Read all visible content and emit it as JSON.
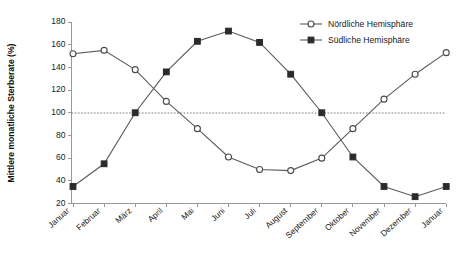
{
  "chart_data": {
    "type": "line",
    "title": "",
    "xlabel": "",
    "ylabel": "Mittlere monatliche Sterberate (%)",
    "ylim": [
      20,
      180
    ],
    "ytick_step": 20,
    "yticks": [
      180,
      160,
      140,
      120,
      100,
      80,
      60,
      40,
      20
    ],
    "grid": false,
    "legend_position": "top-right",
    "reference_line": {
      "value": 100,
      "style": "dotted",
      "label": ""
    },
    "categories": [
      "Januar",
      "Februar",
      "März",
      "April",
      "Mai",
      "Juni",
      "Juli",
      "August",
      "September",
      "Oktober",
      "November",
      "Dezember",
      "Januar"
    ],
    "series": [
      {
        "name": "Nördliche Hemisphäre",
        "marker": "open-circle",
        "color": "#4a4a4a",
        "values": [
          152,
          155,
          138,
          110,
          86,
          61,
          50,
          49,
          60,
          86,
          112,
          134,
          153
        ]
      },
      {
        "name": "Südliche Hemisphäre",
        "marker": "filled-square",
        "color": "#2b2b2b",
        "values": [
          35,
          55,
          100,
          136,
          163,
          172,
          162,
          134,
          100,
          61,
          35,
          26,
          35
        ]
      }
    ]
  },
  "legend": {
    "items": [
      {
        "label": "Nördliche Hemisphäre",
        "marker": "open-circle"
      },
      {
        "label": "Südliche Hemisphäre",
        "marker": "filled-square"
      }
    ]
  },
  "axis": {
    "y_title": "Mittlere monatliche Sterberate (%)"
  }
}
